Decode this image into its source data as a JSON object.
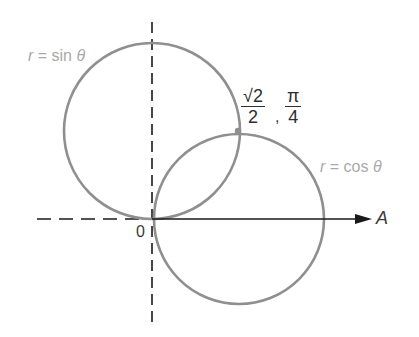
{
  "diagram": {
    "labels": {
      "sin_curve": {
        "r": "r",
        "eq": " = sin ",
        "theta": "θ"
      },
      "cos_curve": {
        "r": "r",
        "eq": " = cos ",
        "theta": "θ"
      },
      "origin": "0",
      "axis": "A",
      "intersection": {
        "r_num": "√2",
        "r_den": "2",
        "sep": ",",
        "theta_num": "π",
        "theta_den": "4"
      }
    },
    "colors": {
      "curve": "#8f8f8f",
      "axis": "#1a1a1a",
      "label_light": "#a9a9a9",
      "label_dark": "#2e2e2e"
    },
    "geometry": {
      "origin": [
        152,
        219
      ],
      "sin_circle": {
        "cx": 152,
        "cy": 131,
        "r": 88
      },
      "cos_circle": {
        "cx": 239,
        "cy": 219,
        "r": 85
      },
      "intersection_point": [
        238,
        131
      ]
    }
  }
}
